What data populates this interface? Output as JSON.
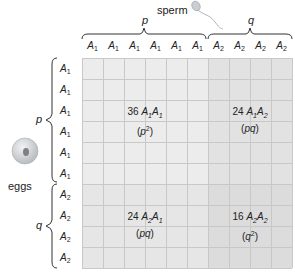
{
  "figure": {
    "top_label": "sperm",
    "side_label": "eggs",
    "col_groups": [
      {
        "label": "p",
        "count": 6,
        "allele": "A",
        "sub": "1"
      },
      {
        "label": "q",
        "count": 4,
        "allele": "A",
        "sub": "2"
      }
    ],
    "row_groups": [
      {
        "label": "p",
        "count": 6,
        "allele": "A",
        "sub": "1"
      },
      {
        "label": "q",
        "count": 4,
        "allele": "A",
        "sub": "2"
      }
    ],
    "quadrants": [
      {
        "count": "36",
        "genotype": [
          "A",
          "1",
          "A",
          "1"
        ],
        "freq": "p",
        "freq_sup": "2",
        "color": "#ececec"
      },
      {
        "count": "24",
        "genotype": [
          "A",
          "1",
          "A",
          "2"
        ],
        "freq": "pq",
        "freq_sup": "",
        "color": "#e2e2e2"
      },
      {
        "count": "24",
        "genotype": [
          "A",
          "2",
          "A",
          "1"
        ],
        "freq": "pq",
        "freq_sup": "",
        "color": "#e6e6e6"
      },
      {
        "count": "16",
        "genotype": [
          "A",
          "2",
          "A",
          "2"
        ],
        "freq": "q",
        "freq_sup": "2",
        "color": "#dcdcdc"
      }
    ],
    "colors": {
      "grid_line": "#c8c8c8",
      "text": "#222222",
      "brace": "#333333"
    }
  }
}
